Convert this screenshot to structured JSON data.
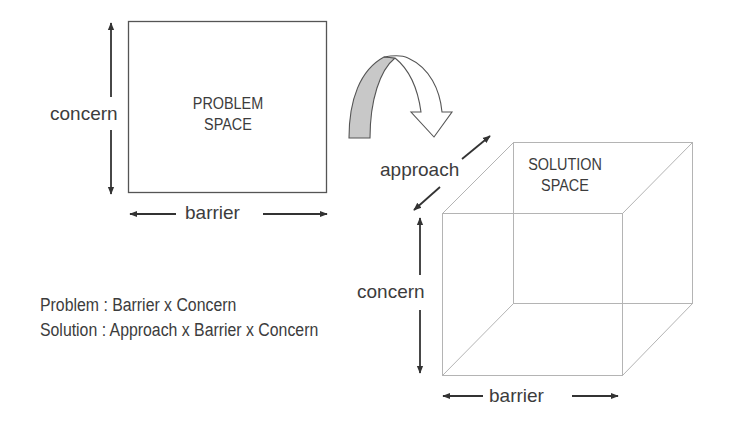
{
  "problem_space": {
    "title_line1": "PROBLEM",
    "title_line2": "SPACE",
    "vertical_axis_label": "concern",
    "horizontal_axis_label": "barrier"
  },
  "transition_arrow": {
    "icon": "curved-arrow-icon",
    "back_color": "#c8c8c8",
    "front_color": "#ffffff"
  },
  "solution_space": {
    "title_line1": "SOLUTION",
    "title_line2": "SPACE",
    "depth_axis_label": "approach",
    "vertical_axis_label": "concern",
    "horizontal_axis_label": "barrier"
  },
  "formulas": {
    "problem": "Problem : Barrier x Concern",
    "solution": "Solution : Approach x Barrier x Concern"
  },
  "colors": {
    "text": "#3c3c3c",
    "arrow": "#333333",
    "box_line": "#555555",
    "cube_line": "#b4b4b4"
  }
}
